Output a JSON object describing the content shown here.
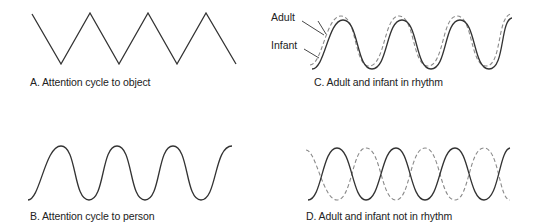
{
  "panels": {
    "a": {
      "caption": "A. Attention cycle to object",
      "shape": "zigzag"
    },
    "b": {
      "caption": "B. Attention cycle to person",
      "shape": "sine"
    },
    "c": {
      "caption": "C. Adult and infant in rhythm",
      "shape": "in-phase sine pair",
      "labels": {
        "adult": "Adult",
        "infant": "Infant"
      }
    },
    "d": {
      "caption": "D. Adult and infant not in rhythm",
      "shape": "out-of-phase sine pair"
    }
  },
  "legend": {
    "adult": {
      "style": "dashed",
      "color": "#8a8a8a"
    },
    "infant": {
      "style": "solid",
      "color": "#333333"
    }
  },
  "colors": {
    "line": "#333333",
    "dashed": "#8a8a8a",
    "background": "#ffffff"
  }
}
